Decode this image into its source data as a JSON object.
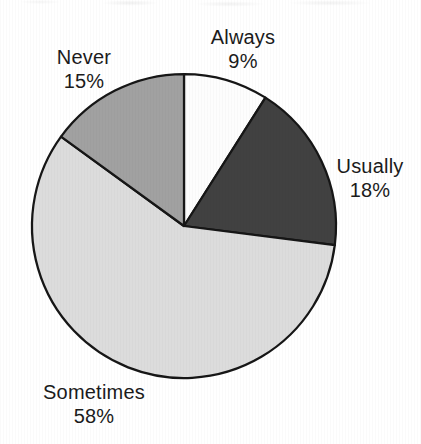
{
  "chart_data": {
    "type": "pie",
    "title": "",
    "direction": "clockwise",
    "start_angle_deg": 0,
    "background_color": "#ffffff",
    "outline_color": "#161616",
    "label_color": "#1b1b1b",
    "slices": [
      {
        "label": "Always",
        "value": 9,
        "pct_label": "9%",
        "color": "#fdfdfd"
      },
      {
        "label": "Usually",
        "value": 18,
        "pct_label": "18%",
        "color": "#414141"
      },
      {
        "label": "Sometimes",
        "value": 58,
        "pct_label": "58%",
        "color": "#dcdcdc"
      },
      {
        "label": "Never",
        "value": 15,
        "pct_label": "15%",
        "color": "#a1a1a1"
      }
    ]
  }
}
